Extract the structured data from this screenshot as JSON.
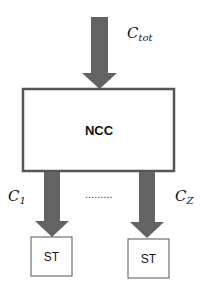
{
  "diagram": {
    "type": "block-diagram",
    "colors": {
      "arrow": "#636363",
      "box_stroke": "#555555",
      "text": "#111111"
    },
    "input": {
      "label_main": "C",
      "label_sub": "tot"
    },
    "central_node": {
      "label": "NCC"
    },
    "outputs": [
      {
        "label_main": "C",
        "label_sub": "1",
        "target": "ST"
      },
      {
        "label_main": "C",
        "label_sub": "Z",
        "target": "ST"
      }
    ],
    "ellipsis": "........."
  }
}
